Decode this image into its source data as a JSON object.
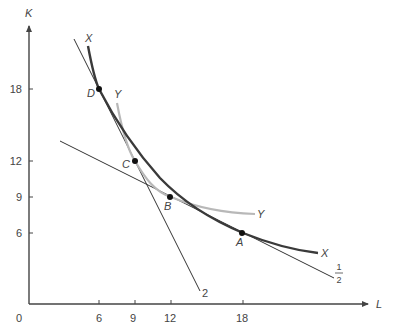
{
  "figure": {
    "type": "isoquant-diagram",
    "axes": {
      "x_label": "L",
      "y_label": "K",
      "origin_label": "0",
      "x_ticks": [
        {
          "value": 6,
          "label": "6",
          "px": 99
        },
        {
          "value": 9,
          "label": "9",
          "px": 135
        },
        {
          "value": 12,
          "label": "12",
          "px": 171
        },
        {
          "value": 18,
          "label": "18",
          "px": 243
        }
      ],
      "y_ticks": [
        {
          "value": 18,
          "label": "18",
          "py": 89
        },
        {
          "value": 12,
          "label": "12",
          "py": 161
        },
        {
          "value": 9,
          "label": "9",
          "py": 197
        },
        {
          "value": 6,
          "label": "6",
          "py": 233
        }
      ]
    },
    "curves": [
      {
        "id": "X",
        "label_start": "X",
        "label_end": "X",
        "color": "#444444",
        "description": "isoquant X (through D and A)"
      },
      {
        "id": "Y",
        "label_start": "Y",
        "label_end": "Y",
        "color": "#b5b5b5",
        "description": "isoquant Y (through C and B)"
      }
    ],
    "lines": [
      {
        "id": "steep",
        "label": "2",
        "slope": -2,
        "color": "#333333",
        "description": "isocost line with slope 2 through D and C"
      },
      {
        "id": "flat",
        "label_num": "1",
        "label_den": "2",
        "slope": -0.5,
        "color": "#333333",
        "description": "isocost line with slope 1/2 through B and A"
      }
    ],
    "points": [
      {
        "label": "D",
        "L": 6,
        "K": 18
      },
      {
        "label": "C",
        "L": 9,
        "K": 12
      },
      {
        "label": "B",
        "L": 12,
        "K": 9
      },
      {
        "label": "A",
        "L": 18,
        "K": 6
      }
    ],
    "colors": {
      "axis": "#444444",
      "text": "#444444",
      "curve_x": "#3a3a3a",
      "curve_y": "#b8b8b8",
      "lines": "#333333",
      "points": "#111111"
    }
  }
}
